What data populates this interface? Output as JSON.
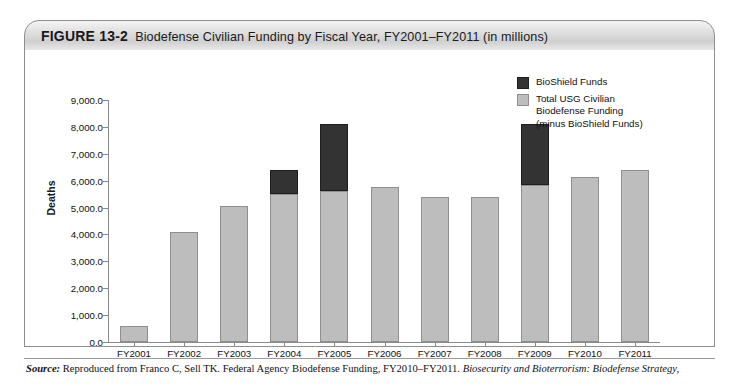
{
  "figure": {
    "number": "FIGURE 13-2",
    "title": "Biodefense Civilian Funding by Fiscal Year, FY2001–FY2011 (in millions)"
  },
  "legend": {
    "position": "top-right",
    "items": [
      {
        "label": "BioShield Funds",
        "color": "#333333",
        "swatch": "black-swatch"
      },
      {
        "label": "Total USG Civilian\nBiodefense Funding\n(minus BioShield Funds)",
        "color": "#bdbdbd",
        "swatch": "gray-swatch"
      }
    ]
  },
  "source": {
    "label": "Source:",
    "text_plain": " Reproduced from Franco C, Sell TK. Federal Agency Biodefense Funding, FY2010–FY2011. ",
    "text_italic": "Biosecurity and Bioterrorism: Biodefense Strategy,"
  },
  "chart_data": {
    "type": "bar",
    "title": "Biodefense Civilian Funding by Fiscal Year, FY2001–FY2011 (in millions)",
    "xlabel": "",
    "ylabel": "Deaths",
    "ylim": [
      0,
      9000
    ],
    "ytick_step": 1000,
    "ytick_labels": [
      "0.0",
      "1,000.0",
      "2,000.0",
      "3,000.0",
      "4,000.0",
      "5,000.0",
      "6,000.0",
      "7,000.0",
      "8,000.0",
      "9,000.0"
    ],
    "grid": false,
    "stacked": true,
    "legend_position": "top-right",
    "categories": [
      "FY2001",
      "FY2002",
      "FY2003",
      "FY2004",
      "FY2005",
      "FY2006",
      "FY2007",
      "FY2008",
      "FY2009",
      "FY2010",
      "FY2011"
    ],
    "series": [
      {
        "name": "Total USG Civilian Biodefense Funding (minus BioShield Funds)",
        "color": "#bdbdbd",
        "values": [
          600,
          4100,
          5050,
          5500,
          5600,
          5750,
          5400,
          5375,
          5850,
          6150,
          6400
        ]
      },
      {
        "name": "BioShield Funds",
        "color": "#333333",
        "values": [
          0,
          0,
          0,
          900,
          2500,
          0,
          0,
          0,
          2250,
          0,
          0
        ]
      }
    ],
    "totals": [
      600,
      4100,
      5050,
      6400,
      8100,
      5750,
      5400,
      5375,
      8100,
      6150,
      6400
    ]
  }
}
